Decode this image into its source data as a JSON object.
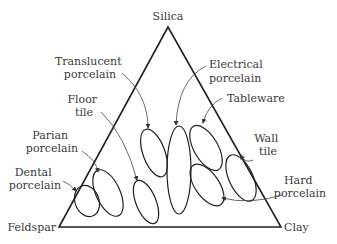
{
  "diagram": {
    "type": "ternary",
    "vertices": {
      "top": "Silica",
      "left": "Feldspar",
      "right": "Clay"
    },
    "regions": [
      {
        "name": "Translucent porcelain",
        "lines": [
          "Translucent",
          "porcelain"
        ]
      },
      {
        "name": "Floor tile",
        "lines": [
          "Floor",
          "tile"
        ]
      },
      {
        "name": "Parian porcelain",
        "lines": [
          "Parian",
          "porcelain"
        ]
      },
      {
        "name": "Dental porcelain",
        "lines": [
          "Dental",
          "porcelain"
        ]
      },
      {
        "name": "Electrical porcelain",
        "lines": [
          "Electrical",
          "porcelain"
        ]
      },
      {
        "name": "Tableware",
        "lines": [
          "Tableware"
        ]
      },
      {
        "name": "Wall tile",
        "lines": [
          "Wall",
          "tile"
        ]
      },
      {
        "name": "Hard porcelain",
        "lines": [
          "Hard",
          "porcelain"
        ]
      }
    ]
  }
}
